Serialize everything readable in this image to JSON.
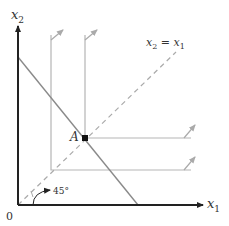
{
  "diagram": {
    "axes": {
      "x_label": "x",
      "x_sub": "1",
      "y_label": "x",
      "y_sub": "2",
      "origin_label": "0"
    },
    "diagonal_label": {
      "lhs": "x",
      "lhs_sub": "2",
      "eq": " = ",
      "rhs": "x",
      "rhs_sub": "1"
    },
    "point_label": "A",
    "angle_label": "45°",
    "colors": {
      "axis": "#222222",
      "budget_line": "#8a8a8a",
      "indifference": "#b5b5b5",
      "diagonal": "#aaaaaa",
      "point": "#111111"
    }
  }
}
